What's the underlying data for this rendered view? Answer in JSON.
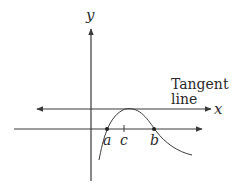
{
  "diagram": {
    "axis_labels": {
      "y": "y",
      "x": "x"
    },
    "tangent_label": {
      "line1": "Tangent",
      "line2": "line"
    },
    "points": [
      {
        "label": "a",
        "x": 107,
        "y": 129,
        "marker": "dot"
      },
      {
        "label": "c",
        "x": 124,
        "y": 129,
        "marker": "tick"
      },
      {
        "label": "b",
        "x": 154,
        "y": 129,
        "marker": "dot"
      }
    ],
    "colors": {
      "line": "#3a3a3a",
      "text": "#2a2a2a",
      "background": "#ffffff"
    }
  }
}
